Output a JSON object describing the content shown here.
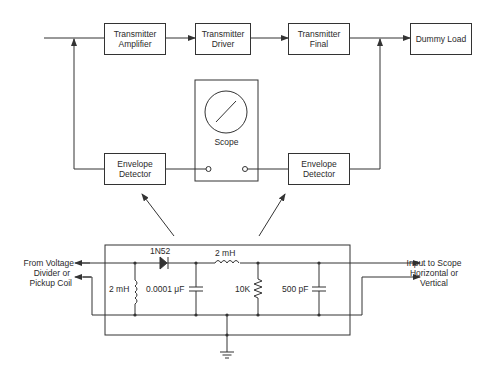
{
  "diagram": {
    "type": "block-and-schematic",
    "top_chain": [
      {
        "id": "tx_amp",
        "label_line1": "Transmitter",
        "label_line2": "Amplifier"
      },
      {
        "id": "tx_driver",
        "label_line1": "Transmitter",
        "label_line2": "Driver"
      },
      {
        "id": "tx_final",
        "label_line1": "Transmitter",
        "label_line2": "Final"
      },
      {
        "id": "dummy_load",
        "label_line1": "Dummy Load",
        "label_line2": ""
      }
    ],
    "scope": {
      "label": "Scope"
    },
    "detectors": [
      {
        "id": "env_det_left",
        "label_line1": "Envelope",
        "label_line2": "Detector"
      },
      {
        "id": "env_det_right",
        "label_line1": "Envelope",
        "label_line2": "Detector"
      }
    ],
    "schematic": {
      "input_label": [
        "From Voltage",
        "Divider or",
        "Pickup Coil"
      ],
      "output_label": [
        "Input to Scope",
        "Horizontal or",
        "Vertical"
      ],
      "components": {
        "diode": "1N52",
        "inductor_shunt": "2 mH",
        "capacitor_1": "0.0001 μF",
        "inductor_series": "2 mH",
        "resistor": "10K",
        "capacitor_2": "500 pF"
      }
    },
    "colors": {
      "line": "#333333",
      "background": "#ffffff"
    }
  }
}
